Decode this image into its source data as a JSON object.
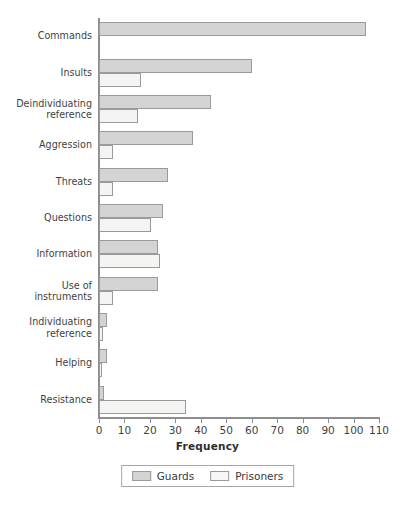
{
  "chart_data": {
    "type": "bar",
    "orientation": "horizontal",
    "title": "",
    "xlabel": "Frequency",
    "ylabel": "",
    "xlim": [
      0,
      110
    ],
    "xticks": [
      0,
      10,
      20,
      30,
      40,
      50,
      60,
      70,
      80,
      90,
      100,
      110
    ],
    "grid": false,
    "legend_position": "bottom",
    "categories": [
      "Commands",
      "Insults",
      "Deindividuating\nreference",
      "Aggression",
      "Threats",
      "Questions",
      "Information",
      "Use of\ninstruments",
      "Individuating\nreference",
      "Helping",
      "Resistance"
    ],
    "series": [
      {
        "name": "Guards",
        "color": "#d4d4d4",
        "values": [
          105,
          60,
          44,
          37,
          27,
          25,
          23,
          23,
          3,
          3,
          2
        ]
      },
      {
        "name": "Prisoners",
        "color": "#f4f4f2",
        "values": [
          0,
          16.5,
          15.5,
          5.5,
          5.5,
          20.5,
          24,
          5.5,
          1.5,
          1,
          34
        ]
      }
    ]
  },
  "legend": {
    "items": [
      {
        "label": "Guards",
        "swatch": "guards"
      },
      {
        "label": "Prisoners",
        "swatch": "prisoners"
      }
    ]
  }
}
